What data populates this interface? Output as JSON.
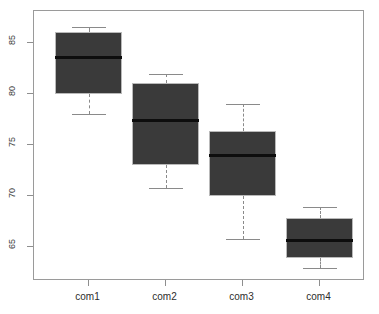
{
  "chart_data": {
    "type": "box",
    "title": "",
    "xlabel": "",
    "ylabel": "",
    "ylim": [
      62.2,
      87.3
    ],
    "yticks": [
      65,
      70,
      75,
      80,
      85
    ],
    "ytick_labels": [
      "65",
      "70",
      "75",
      "80",
      "85"
    ],
    "grid": false,
    "legend": null,
    "categories": [
      "com1",
      "com2",
      "com3",
      "com4"
    ],
    "boxes": [
      {
        "name": "com1",
        "whisker_low": 78.0,
        "q1": 80.0,
        "median": 83.5,
        "q3": 86.0,
        "whisker_high": 86.5,
        "outliers": []
      },
      {
        "name": "com2",
        "whisker_low": 70.8,
        "q1": 73.0,
        "median": 77.4,
        "q3": 81.0,
        "whisker_high": 81.9,
        "outliers": []
      },
      {
        "name": "com3",
        "whisker_low": 65.8,
        "q1": 70.0,
        "median": 74.0,
        "q3": 76.4,
        "whisker_high": 79.0,
        "outliers": []
      },
      {
        "name": "com4",
        "whisker_low": 63.0,
        "q1": 64.0,
        "median": 65.7,
        "q3": 67.9,
        "whisker_high": 68.9,
        "outliers": []
      }
    ],
    "colors": {
      "box_fill": "#3a3a3a",
      "box_border": "#b9b9b9",
      "median_line": "#0d0d0d",
      "whisker": "#8a8a8a",
      "frame": "#9a9a9a",
      "axis_text": "#2d2d2d",
      "background": "#ffffff"
    }
  }
}
